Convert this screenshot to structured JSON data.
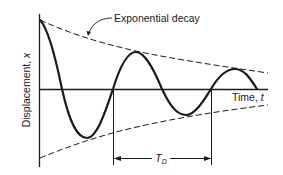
{
  "diagram": {
    "annotation": "Exponential decay",
    "y_axis_label": "Displacement, ",
    "y_axis_var": "x",
    "x_axis_label": "Time, ",
    "x_axis_var": "t",
    "period_label_main": "T",
    "period_label_sub": "D",
    "colors": {
      "line": "#1a1a1a",
      "background": "#ffffff"
    }
  }
}
